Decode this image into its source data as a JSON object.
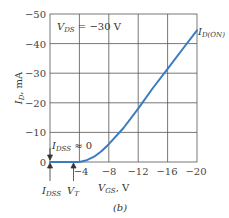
{
  "chart_data": {
    "type": "line",
    "title": "",
    "panel_label": "(b)",
    "xlabel": "V_GS, V",
    "ylabel": "I_D, mA",
    "xlim": [
      0,
      -20
    ],
    "ylim": [
      0,
      -50
    ],
    "grid": true,
    "x_ticks": [
      "-4",
      "-8",
      "-12",
      "-16",
      "-20"
    ],
    "x_tick_values": [
      -4,
      -8,
      -12,
      -16,
      -20
    ],
    "y_ticks": [
      "0",
      "-10",
      "-20",
      "-30",
      "-40",
      "-50"
    ],
    "y_tick_values": [
      0,
      -10,
      -20,
      -30,
      -40,
      -50
    ],
    "series": [
      {
        "name": "I_D vs V_GS",
        "color": "#3a7cc4",
        "x": [
          0,
          -2,
          -4,
          -5,
          -6,
          -7,
          -8,
          -10,
          -12,
          -14,
          -16,
          -18,
          -20
        ],
        "y": [
          0,
          0,
          0,
          -0.6,
          -1.8,
          -3.6,
          -6,
          -11.5,
          -18,
          -25,
          -31.5,
          -38,
          -44.5
        ]
      }
    ],
    "annotations": {
      "condition": "V_DS = −30 V",
      "idss_approx": "I_DSS ≈ 0",
      "idss_label": "I_DSS",
      "vt_label": "V_T",
      "id_on_label": "I_D(ON)"
    }
  },
  "labels": {
    "x_axis": {
      "main": "V",
      "sub": "GS",
      "unit": ", V"
    },
    "y_axis": {
      "main": "I",
      "sub": "D",
      "unit": ", mA"
    },
    "condition": {
      "main": "V",
      "sub": "DS",
      "rest": " = −30 V"
    },
    "idss_approx": {
      "main": "I",
      "sub": "DSS",
      "rest": " ≈ 0"
    },
    "idss_arrow": {
      "main": "I",
      "sub": "DSS"
    },
    "vt_arrow": {
      "main": "V",
      "sub": "T"
    },
    "id_on": {
      "main": "I",
      "sub": "D(ON)"
    },
    "panel": "(b)",
    "y_ticks": [
      "−50",
      "−40",
      "−30",
      "−20",
      "−10",
      "0"
    ],
    "x_ticks": [
      "−4",
      "−8",
      "−12",
      "−16",
      "−20"
    ]
  }
}
